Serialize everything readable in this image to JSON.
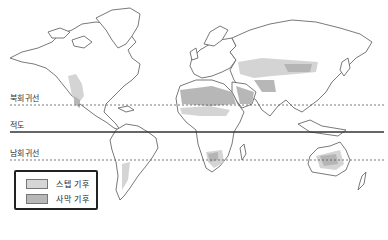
{
  "map": {
    "type": "world-climate-map",
    "lines": [
      {
        "id": "tropic-of-cancer",
        "label": "북회귀선",
        "style": "dashed",
        "y": 105
      },
      {
        "id": "equator",
        "label": "적도",
        "style": "solid",
        "y": 132
      },
      {
        "id": "tropic-of-capricorn",
        "label": "남회귀선",
        "style": "dashed",
        "y": 160
      }
    ]
  },
  "labels": {
    "tropic_of_cancer": "북회귀선",
    "equator": "적도",
    "tropic_of_capricorn": "남회귀선"
  },
  "legend": {
    "items": [
      {
        "label": "스텝 기후",
        "color": "#d6d6d6"
      },
      {
        "label": "사막 기후",
        "color": "#b8b8b8"
      }
    ]
  },
  "colors": {
    "steppe": "#d6d6d6",
    "desert": "#b8b8b8",
    "outline": "#6a6a6a",
    "lines": "#333333"
  }
}
